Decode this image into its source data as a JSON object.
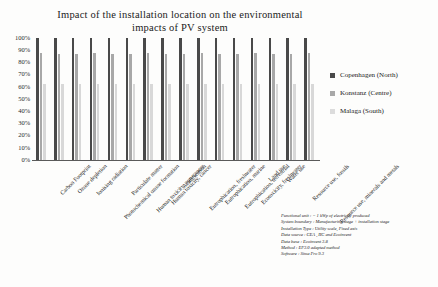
{
  "chart_data": {
    "type": "bar",
    "title": "Impact of the installation location on the environmental impacts of PV system",
    "title_line1": "Impact of the installation location on the environmental",
    "title_line2": "impacts of PV system",
    "xlabel": "",
    "ylabel": "",
    "ylim": [
      0,
      100
    ],
    "grid": false,
    "legend_position": "right",
    "ytick_labels": [
      "100%",
      "90%",
      "80%",
      "70%",
      "60%",
      "50%",
      "40%",
      "30%",
      "20%",
      "10%",
      "0%"
    ],
    "ytick_values": [
      100,
      90,
      80,
      70,
      60,
      50,
      40,
      30,
      20,
      10,
      0
    ],
    "categories": [
      "Carbon Footprint",
      "Ozone depletion",
      "Ionising radiation",
      "Photochemical ozone formation",
      "Particulate matter",
      "Human toxicity, non-cancer",
      "Human toxicity, cancer",
      "Acidification",
      "Eutrophication, freshwater",
      "Eutrophication, marine",
      "Eutrophication, terrestrial",
      "Ecotoxicity, freshwater",
      "Land use",
      "Water use",
      "Resource use, fossils",
      "Resource use, minerals and metals"
    ],
    "series": [
      {
        "name": "Copenhagen (North)",
        "color": "#494949",
        "values": [
          100,
          100,
          100,
          100,
          100,
          100,
          100,
          100,
          100,
          100,
          100,
          100,
          100,
          100,
          100,
          100
        ]
      },
      {
        "name": "Konstanz (Centre)",
        "color": "#a8a8a8",
        "values": [
          88,
          87,
          87,
          88,
          87,
          87,
          88,
          87,
          87,
          88,
          87,
          87,
          88,
          87,
          87,
          88
        ]
      },
      {
        "name": "Malaga (South)",
        "color": "#d8d8d8",
        "values": [
          62,
          62,
          62,
          62,
          62,
          62,
          62,
          62,
          62,
          62,
          62,
          62,
          62,
          62,
          62,
          62
        ]
      }
    ]
  },
  "legend": {
    "items": [
      {
        "label": "Copenhagen (North)"
      },
      {
        "label": "Konstanz (Centre)"
      },
      {
        "label": "Malaga (South)"
      }
    ]
  },
  "footnote": {
    "lines": [
      "Functional unit : = 1 kWp of electricity produced",
      "System boundary : Manufacturing stage + installation stage",
      "Installation Type : Utility scale, Fixed axis",
      "Data source : CEA , IIC and Ecoinvent",
      "Data base : Ecoinvent 3.8",
      "Method : EF3.0 adapted method",
      "Software : Sima Pro 9.3"
    ]
  }
}
